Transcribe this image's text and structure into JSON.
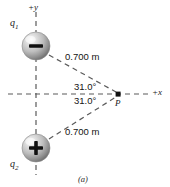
{
  "figure": {
    "caption": "(a)",
    "axes": {
      "y_label": "+y",
      "x_label": "+x"
    },
    "charges": [
      {
        "id": "q1",
        "label": "q",
        "subscript": "1",
        "sign": "−",
        "sign_name": "negative",
        "cx": 36,
        "cy": 46,
        "r": 14
      },
      {
        "id": "q2",
        "label": "q",
        "subscript": "2",
        "sign": "+",
        "sign_name": "positive",
        "cx": 36,
        "cy": 148,
        "r": 14
      }
    ],
    "field_point": {
      "label": "P",
      "x": 118,
      "y": 94
    },
    "distances": [
      {
        "id": "d1",
        "value": "0.700 m"
      },
      {
        "id": "d2",
        "value": "0.700 m"
      }
    ],
    "angles": [
      {
        "id": "a1",
        "value": "31.0°"
      },
      {
        "id": "a2",
        "value": "31.0°"
      }
    ],
    "colors": {
      "line": "#5a5a5a",
      "text": "#1a1a1a",
      "sphere_light": "#f0f0f0",
      "sphere_mid": "#b8b8b8",
      "sphere_dark": "#6e6e6e",
      "background": "#ffffff"
    }
  }
}
